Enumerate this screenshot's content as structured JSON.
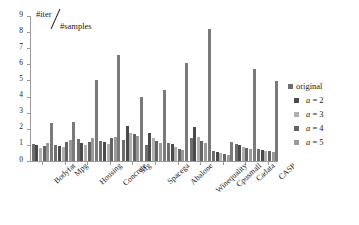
{
  "chart_data": {
    "type": "bar",
    "title": "",
    "subtitle": "",
    "xlabel": "",
    "ylabel": "#iter/#samples",
    "ylabel_numerator": "#iter",
    "ylabel_denominator": "#samples",
    "ylim": [
      0,
      9
    ],
    "ytick_values": [
      0,
      1,
      2,
      3,
      4,
      5,
      6,
      7,
      8,
      9
    ],
    "ytick_labels": [
      "0",
      "1",
      "2",
      "3",
      "4",
      "5",
      "6",
      "7",
      "8",
      "9"
    ],
    "grid": false,
    "legend_position": "right",
    "categories": [
      "Bodyfat",
      "Mpg",
      "Housing",
      "Concrete",
      "Mg",
      "Spacega",
      "Abalone",
      "Winequality",
      "Cpusmall",
      "Cadata",
      "CASP"
    ],
    "series": [
      {
        "name": "original",
        "color": "#6e6e6e",
        "values": [
          1.05,
          1.0,
          1.35,
          1.25,
          1.3,
          1.0,
          1.1,
          1.4,
          0.6,
          1.05,
          0.75
        ]
      },
      {
        "name": "a = 2",
        "color": "#4a4a4a",
        "values": [
          1.0,
          0.95,
          1.1,
          1.2,
          2.15,
          1.75,
          1.05,
          2.1,
          0.55,
          1.0,
          0.7
        ]
      },
      {
        "name": "a = 3",
        "color": "#b0b0b0",
        "values": [
          0.8,
          0.85,
          1.0,
          1.05,
          1.75,
          1.4,
          0.85,
          1.5,
          0.5,
          0.85,
          0.65
        ]
      },
      {
        "name": "a = 4",
        "color": "#636363",
        "values": [
          0.95,
          1.15,
          1.2,
          1.4,
          1.65,
          1.25,
          0.75,
          1.25,
          0.45,
          0.8,
          0.6
        ]
      },
      {
        "name": "a = 5",
        "color": "#9a9a9a",
        "values": [
          1.1,
          1.3,
          1.45,
          1.5,
          1.55,
          1.1,
          0.7,
          1.1,
          0.4,
          0.75,
          0.55
        ]
      },
      {
        "name": "tall",
        "color": "#7a7a7a",
        "values": [
          2.35,
          2.4,
          5.05,
          6.6,
          3.95,
          4.4,
          6.1,
          8.2,
          1.15,
          5.7,
          4.95
        ]
      }
    ]
  },
  "legend": {
    "items": [
      {
        "label": "original",
        "italic_prefix": "",
        "color": "#6e6e6e"
      },
      {
        "label": "a = 2",
        "italic_prefix": "a",
        "color": "#4a4a4a"
      },
      {
        "label": "a = 3",
        "italic_prefix": "a",
        "color": "#b0b0b0"
      },
      {
        "label": "a = 4",
        "italic_prefix": "a",
        "color": "#636363"
      },
      {
        "label": "a = 5",
        "italic_prefix": "a",
        "color": "#9a9a9a"
      }
    ]
  }
}
